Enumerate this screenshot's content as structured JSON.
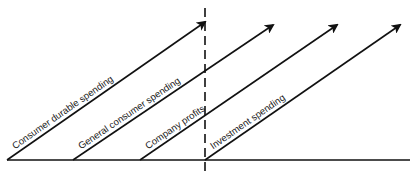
{
  "diagram": {
    "colors": {
      "line": "#111111",
      "background": "#ffffff"
    },
    "baseline": {
      "x1": 7,
      "y1": 160,
      "x2": 410,
      "y2": 160
    },
    "divider": {
      "x": 205,
      "y1": 8,
      "y2": 172,
      "style": "dashed"
    },
    "arrows": [
      {
        "label": "Consumer durable spending",
        "x1": 7,
        "y1": 160,
        "x2": 205,
        "y2": 22
      },
      {
        "label": "General consumer spending",
        "x1": 73,
        "y1": 160,
        "x2": 273,
        "y2": 25
      },
      {
        "label": "Company profits",
        "x1": 140,
        "y1": 160,
        "x2": 337,
        "y2": 25
      },
      {
        "label": "Investment spending",
        "x1": 205,
        "y1": 160,
        "x2": 400,
        "y2": 25
      }
    ]
  }
}
